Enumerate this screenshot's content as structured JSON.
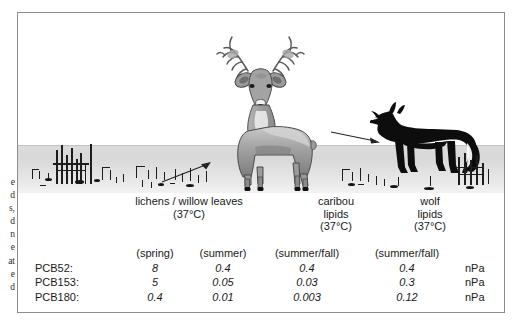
{
  "margin_column_fragments": [
    "e",
    "d",
    "s,",
    "d",
    "n",
    "e",
    "at",
    "e",
    "d"
  ],
  "illustration": {
    "scene_name": "arctic-tundra-food-chain",
    "organisms": [
      {
        "name": "willow-shrub-vegetation",
        "icon": "shrub-icon"
      },
      {
        "name": "caribou",
        "icon": "deer-icon"
      },
      {
        "name": "wolf",
        "icon": "wolf-silhouette-icon"
      }
    ],
    "arrows": [
      {
        "name": "arrow-vegetation-to-caribou",
        "icon": "arrow-up-right-icon"
      },
      {
        "name": "arrow-caribou-to-wolf",
        "icon": "arrow-right-icon"
      }
    ]
  },
  "captions": {
    "lichen": {
      "line1": "lichens / willow leaves",
      "line2": "(37°C)",
      "line3": "",
      "line4": ""
    },
    "caribou": {
      "line1": "caribou",
      "line2": "lipids",
      "line3": "(37°C)",
      "line4": ""
    },
    "wolf": {
      "line1": "wolf",
      "line2": "lipids",
      "line3": "(37°C)",
      "line4": ""
    }
  },
  "table": {
    "season_headers": {
      "blank": "",
      "spring": "(spring)",
      "summer": "(summer)",
      "caribou": "(summer/fall)",
      "wolf": "(summer/fall)",
      "unit_blank": ""
    },
    "rows": [
      {
        "label": "PCB52:",
        "spring": "8",
        "summer": "0.4",
        "caribou": "0.4",
        "wolf": "0.4",
        "unit": "nPa"
      },
      {
        "label": "PCB153:",
        "spring": "5",
        "summer": "0.05",
        "caribou": "0.03",
        "wolf": "0.3",
        "unit": "nPa"
      },
      {
        "label": "PCB180:",
        "spring": "0.4",
        "summer": "0.01",
        "caribou": "0.003",
        "wolf": "0.12",
        "unit": "nPa"
      }
    ]
  },
  "colors": {
    "frame_border": "#8d8d8d",
    "ground_band": "#dcdcdc",
    "caribou_body": "#9a9a9a",
    "wolf_silhouette": "#0d0d0d",
    "text": "#1a1a1a"
  }
}
